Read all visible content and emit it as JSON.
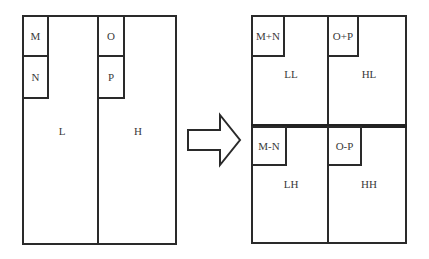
{
  "left_panel": {
    "regions": {
      "low": "L",
      "high": "H"
    },
    "subbands": {
      "m": "M",
      "n": "N",
      "o": "O",
      "p": "P"
    }
  },
  "arrow": {
    "icon": "right-arrow-icon"
  },
  "right_panel": {
    "quadrants": {
      "ll": "LL",
      "hl": "HL",
      "lh": "LH",
      "hh": "HH"
    },
    "subbands": {
      "m_plus_n": "M+N",
      "o_plus_p": "O+P",
      "m_minus_n": "M-N",
      "o_minus_p": "O-P"
    }
  },
  "colors": {
    "line": "#2a2a2a",
    "text": "#3a3a3a",
    "background": "#ffffff"
  }
}
